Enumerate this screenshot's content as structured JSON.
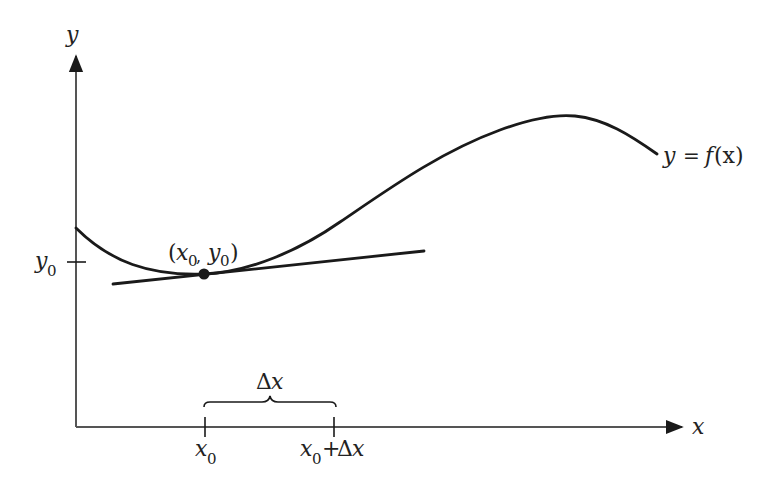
{
  "figure": {
    "axes": {
      "x_label": "x",
      "y_label": "y"
    },
    "curve_label": {
      "lhs": "y",
      "eq": "=",
      "func": "f",
      "arg": "(x)"
    },
    "point_label": {
      "open": "(",
      "x": "x",
      "x_sub": "0",
      "comma": ",",
      "y": "y",
      "y_sub": "0",
      "close": ")"
    },
    "y_tick": {
      "var": "y",
      "sub": "0"
    },
    "x_ticks": [
      {
        "var": "x",
        "sub": "0",
        "suffix": ""
      },
      {
        "var": "x",
        "sub": "0",
        "plus": "+",
        "delta": "Δ",
        "dvar": "x"
      }
    ],
    "brace_label": {
      "delta": "Δ",
      "var": "x"
    },
    "colors": {
      "ink": "#1a1a1a",
      "axis": "#555555"
    }
  }
}
